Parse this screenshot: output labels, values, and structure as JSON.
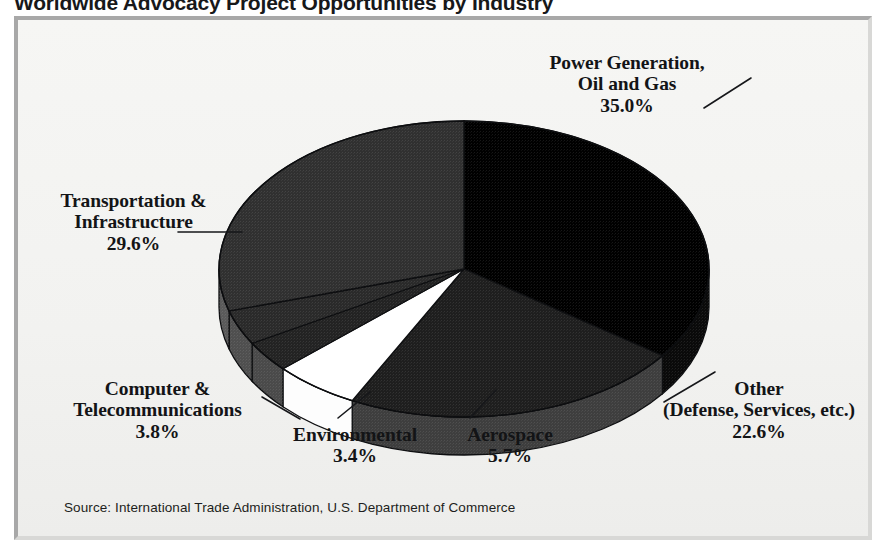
{
  "chart_data": {
    "type": "pie",
    "title": "Worldwide Advocacy Project Opportunities by Industry",
    "source": "Source: International Trade Administration, U.S. Department of Commerce",
    "xlabel": "",
    "ylabel": "",
    "legend_position": "callout-labels",
    "grid": false,
    "three_d": true,
    "start_angle_deg": 0,
    "direction": "clockwise",
    "categories": [
      "Power Generation, Oil and Gas",
      "Other (Defense, Services, etc.)",
      "Aerospace",
      "Environmental",
      "Computer & Telecommunications",
      "Transportation & Infrastructure"
    ],
    "values": [
      35.0,
      22.6,
      5.7,
      3.4,
      3.8,
      29.6
    ],
    "value_labels": [
      "35.0%",
      "22.6%",
      "5.7%",
      "3.4%",
      "3.8%",
      "29.6%"
    ],
    "colors": [
      "#000000",
      "#1e1e1e",
      "#ffffff",
      "#232323",
      "#2a2a2a",
      "#303030"
    ],
    "slices": [
      {
        "name": "Power Generation, Oil and Gas",
        "line1": "Power Generation,",
        "line2": "Oil and Gas",
        "value": 35.0,
        "value_label": "35.0%",
        "color": "#000000",
        "side_color": "#0a0a0a"
      },
      {
        "name": "Other (Defense, Services, etc.)",
        "line1": "Other",
        "line2": "(Defense, Services, etc.)",
        "value": 22.6,
        "value_label": "22.6%",
        "color": "#1e1e1e",
        "side_color": "#3e3e3e"
      },
      {
        "name": "Aerospace",
        "line1": "Aerospace",
        "line2": "",
        "value": 5.7,
        "value_label": "5.7%",
        "color": "#ffffff",
        "side_color": "#fdfdfd"
      },
      {
        "name": "Environmental",
        "line1": "Environmental",
        "line2": "",
        "value": 3.4,
        "value_label": "3.4%",
        "color": "#232323",
        "side_color": "#4a4a4a"
      },
      {
        "name": "Computer & Telecommunications",
        "line1": "Computer &",
        "line2": "Telecommunications",
        "value": 3.8,
        "value_label": "3.8%",
        "color": "#2a2a2a",
        "side_color": "#4f4f4f"
      },
      {
        "name": "Transportation & Infrastructure",
        "line1": "Transportation &",
        "line2": "Infrastructure",
        "value": 29.6,
        "value_label": "29.6%",
        "color": "#303030",
        "side_color": "#5a5a5a"
      }
    ]
  },
  "frame": {
    "background_color": "#f4f4f2",
    "border_color": "#a8a8a8"
  }
}
